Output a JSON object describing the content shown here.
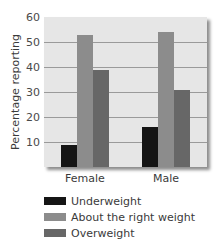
{
  "chart_data": {
    "type": "bar",
    "title": "",
    "xlabel": "",
    "ylabel": "Percentage reporting",
    "ylim": [
      0,
      60
    ],
    "yticks": [
      10,
      20,
      30,
      40,
      50,
      60
    ],
    "grid": true,
    "legend_position": "bottom-left",
    "categories": [
      "Female",
      "Male"
    ],
    "series": [
      {
        "name": "Underweight",
        "values": [
          9,
          16
        ],
        "color": "#151515"
      },
      {
        "name": "About the right weight",
        "values": [
          53,
          54
        ],
        "color": "#8c8c8c"
      },
      {
        "name": "Overweight",
        "values": [
          39,
          31
        ],
        "color": "#676767"
      }
    ]
  },
  "labels": {
    "ylabel": "Percentage reporting",
    "yticks": [
      "10",
      "20",
      "30",
      "40",
      "50",
      "60"
    ],
    "categories": [
      "Female",
      "Male"
    ],
    "legend": [
      "Underweight",
      "About the right weight",
      "Overweight"
    ]
  }
}
